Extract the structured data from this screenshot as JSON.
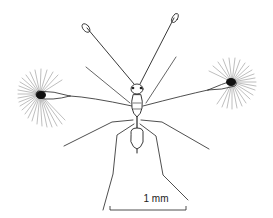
{
  "figure": {
    "scale_bar": {
      "label": "1 mm"
    }
  },
  "colors": {
    "ink": "#1a1a1a",
    "background": "#ffffff"
  }
}
